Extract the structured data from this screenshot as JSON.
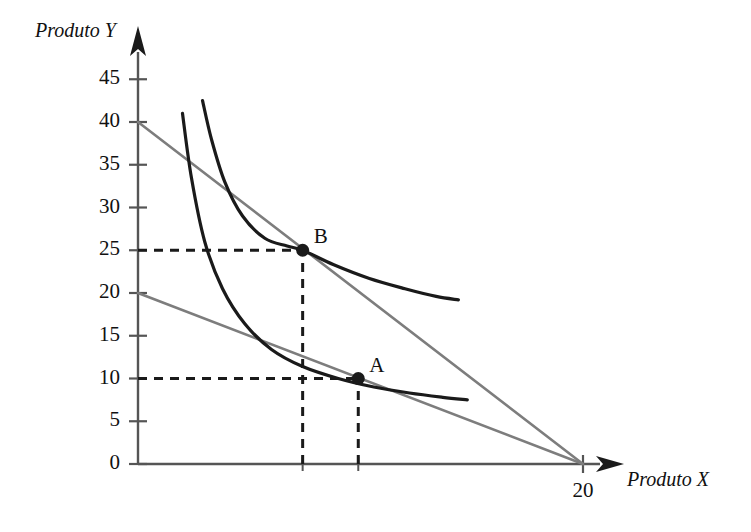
{
  "chart_data": {
    "type": "line",
    "title": "",
    "xlabel": "Produto X",
    "ylabel": "Produto Y",
    "xlim": [
      0,
      22
    ],
    "ylim": [
      0,
      47
    ],
    "grid": false,
    "legend": null,
    "y_ticks": [
      0,
      5,
      10,
      15,
      20,
      25,
      30,
      35,
      40,
      45
    ],
    "y_tick_labels": [
      "0",
      "5",
      "10",
      "15",
      "20",
      "25",
      "30",
      "35",
      "40",
      "45"
    ],
    "x_ticks": [
      20
    ],
    "x_tick_labels": [
      "20"
    ],
    "series": [
      {
        "name": "budget-line-1",
        "kind": "line",
        "color": "#7d7d7d",
        "x": [
          0,
          20
        ],
        "y": [
          20,
          0
        ]
      },
      {
        "name": "budget-line-2",
        "kind": "line",
        "color": "#7d7d7d",
        "x": [
          0,
          20
        ],
        "y": [
          40,
          0
        ]
      },
      {
        "name": "indifference-curve-1",
        "kind": "curve",
        "color": "#1a1a1a",
        "x": [
          2.0,
          2.4,
          3.0,
          3.8,
          4.8,
          6.0,
          7.4,
          9.0,
          10.6,
          12.2,
          13.7,
          14.8
        ],
        "y": [
          41.0,
          33.5,
          26.0,
          20.5,
          16.4,
          13.4,
          11.4,
          10.0,
          9.0,
          8.3,
          7.8,
          7.5
        ]
      },
      {
        "name": "indifference-curve-2",
        "kind": "curve",
        "color": "#1a1a1a",
        "x": [
          2.9,
          3.3,
          3.9,
          4.7,
          5.7,
          6.7,
          7.4,
          8.8,
          10.4,
          12.0,
          13.4,
          14.4
        ],
        "y": [
          42.5,
          38.0,
          33.0,
          29.0,
          26.4,
          25.5,
          25.0,
          23.3,
          21.7,
          20.5,
          19.6,
          19.2
        ]
      }
    ],
    "points": [
      {
        "label": "A",
        "x": 9.9,
        "y": 10,
        "color": "#1a1a1a"
      },
      {
        "label": "B",
        "x": 7.4,
        "y": 25,
        "color": "#1a1a1a"
      }
    ],
    "guides": [
      {
        "name": "guide-h-25",
        "orientation": "horizontal",
        "value": 25,
        "from": 0,
        "to": 7.4,
        "style": "dashed"
      },
      {
        "name": "guide-v-b",
        "orientation": "vertical",
        "value": 7.4,
        "from": 0,
        "to": 25,
        "style": "dashed"
      },
      {
        "name": "guide-h-10",
        "orientation": "horizontal",
        "value": 10,
        "from": 0,
        "to": 9.9,
        "style": "dashed"
      },
      {
        "name": "guide-v-a",
        "orientation": "vertical",
        "value": 9.9,
        "from": 0,
        "to": 10,
        "style": "dashed"
      }
    ],
    "annotations": []
  },
  "axes": {
    "y_title": "Produto Y",
    "x_title": "Produto X"
  },
  "ticks": {
    "y": [
      "45",
      "40",
      "35",
      "30",
      "25",
      "20",
      "15",
      "10",
      "5",
      "0"
    ],
    "x": [
      "20"
    ]
  },
  "points": {
    "a_label": "A",
    "b_label": "B"
  },
  "colors": {
    "background": "#ffffff",
    "axis": "#555555",
    "curve": "#1a1a1a",
    "budget": "#7d7d7d",
    "guide": "#1a1a1a",
    "text": "#111111"
  }
}
